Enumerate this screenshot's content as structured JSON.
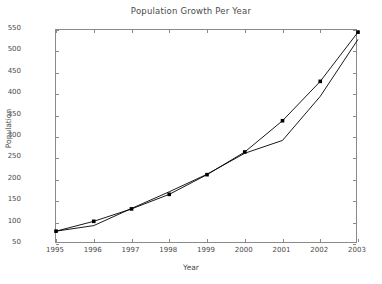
{
  "chart_data": {
    "type": "line",
    "title": "Population Growth Per Year",
    "xlabel": "Year",
    "ylabel": "Population",
    "grid": false,
    "legend": "none",
    "x": [
      1995,
      1996,
      1997,
      1998,
      1999,
      2000,
      2001,
      2002,
      2003
    ],
    "categories": [
      "1995",
      "1996",
      "1997",
      "1998",
      "1999",
      "2000",
      "2001",
      "2002",
      "2003"
    ],
    "xlim": [
      1995,
      2003
    ],
    "ylim": [
      50,
      550
    ],
    "ytick_labels": [
      "550",
      "500",
      "450",
      "400",
      "350",
      "300",
      "250",
      "200",
      "150",
      "100",
      "50"
    ],
    "ytick_values": [
      550,
      500,
      450,
      400,
      350,
      300,
      250,
      200,
      150,
      100,
      50
    ],
    "series": [
      {
        "name": "Population (marked)",
        "marker": "square",
        "color": "#000000",
        "values": [
          80,
          103,
          132,
          166,
          212,
          265,
          338,
          430,
          545
        ]
      },
      {
        "name": "Population (trend)",
        "marker": "none",
        "color": "#000000",
        "values": [
          80,
          93,
          133,
          172,
          213,
          262,
          292,
          395,
          528
        ]
      }
    ]
  }
}
